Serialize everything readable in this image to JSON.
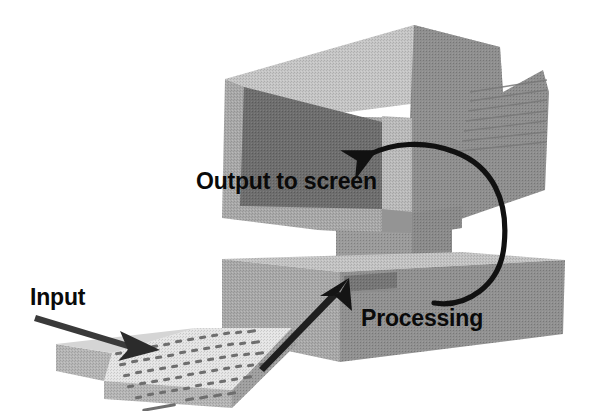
{
  "diagram": {
    "background_color": "#ffffff",
    "labels": {
      "input": "Input",
      "output": "Output to screen",
      "processing": "Processing"
    },
    "palette": {
      "ink": "#111111",
      "arrow_dark": "#2a2a2a",
      "screen": "#6f6f6f",
      "bezel_front": "#a6a6a6",
      "bezel_top": "#bdbdbd",
      "bezel_side": "#8f8f8f",
      "case_top": "#c2c2c2",
      "case_front": "#a8a8a8",
      "case_side": "#8c8c8c",
      "keyboard_top": "#e3e3e3",
      "keyboard_front": "#b9b9b9",
      "keyboard_side": "#9d9d9d",
      "key_mark": "#6a6a6a",
      "slot": "#7b7b7b",
      "neck": "#9a9a9a"
    },
    "parts": [
      {
        "name": "monitor",
        "role": "output-device"
      },
      {
        "name": "screen",
        "role": "display-surface"
      },
      {
        "name": "monitor-stand",
        "role": "support"
      },
      {
        "name": "system-unit",
        "role": "processing-device"
      },
      {
        "name": "floppy-drive-slot",
        "role": "media-slot"
      },
      {
        "name": "keyboard",
        "role": "input-device"
      }
    ],
    "arrows": [
      {
        "name": "input-arrow",
        "from": "Input label",
        "to": "keyboard",
        "style": "straight",
        "color": "#2f2f2f"
      },
      {
        "name": "keyboard-to-unit-arrow",
        "from": "keyboard",
        "to": "floppy-drive-slot",
        "style": "straight",
        "color": "#1f1f1f"
      },
      {
        "name": "processing-to-screen-arrow",
        "from": "Processing label",
        "to": "screen",
        "style": "curved",
        "color": "#111111"
      }
    ]
  }
}
